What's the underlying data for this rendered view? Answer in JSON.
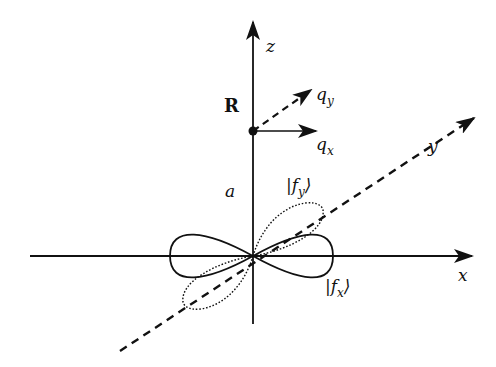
{
  "diagram": {
    "type": "orbital-axes",
    "axes": {
      "x_label": "x",
      "y_label": "y",
      "z_label": "z"
    },
    "point": {
      "label": "R",
      "distance_label": "a"
    },
    "vectors": {
      "qx_label": "q",
      "qx_sub": "x",
      "qy_label": "q",
      "qy_sub": "y"
    },
    "orbitals": {
      "fx_label": "|f",
      "fx_sub": "x",
      "fx_close": "⟩",
      "fy_label": "|f",
      "fy_sub": "y",
      "fy_close": "⟩"
    },
    "colors": {
      "ink": "#111111",
      "background": "#ffffff"
    }
  }
}
